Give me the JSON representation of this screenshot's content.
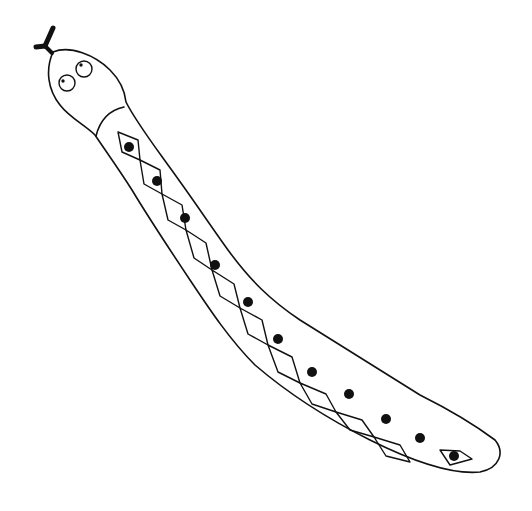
{
  "illustration": {
    "subject": "snake line drawing",
    "colors": {
      "background": "#ffffff",
      "ink": "#111111"
    },
    "head": {
      "tongue": "forked",
      "eyes": 2
    },
    "body": {
      "pattern": "diamond chain with dots",
      "diamond_count": 12
    }
  }
}
